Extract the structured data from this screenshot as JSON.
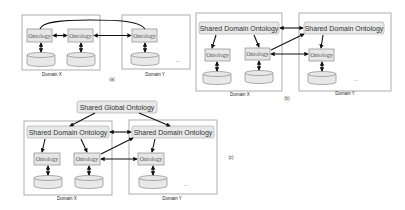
{
  "labels": {
    "ontology": "Ontology",
    "shared_domain": "Shared Domain Ontology",
    "shared_global": "Shared Global Ontology",
    "domain_x": "Domain X",
    "domain_y": "Domain Y",
    "ellipsis": "...",
    "panel_a": "(a)",
    "panel_b": "(b)",
    "panel_c": "(c)"
  },
  "panels": [
    {
      "id": "a",
      "description": "Peer-to-peer ontology mapping between domains"
    },
    {
      "id": "b",
      "description": "Shared domain ontologies per domain"
    },
    {
      "id": "c",
      "description": "Shared global ontology over shared domain ontologies"
    }
  ],
  "colors": {
    "box_fill": "#e6e6e6",
    "box_stroke": "#8a8a8a",
    "domain_stroke": "#9a9a9a",
    "arrow": "#111111"
  }
}
